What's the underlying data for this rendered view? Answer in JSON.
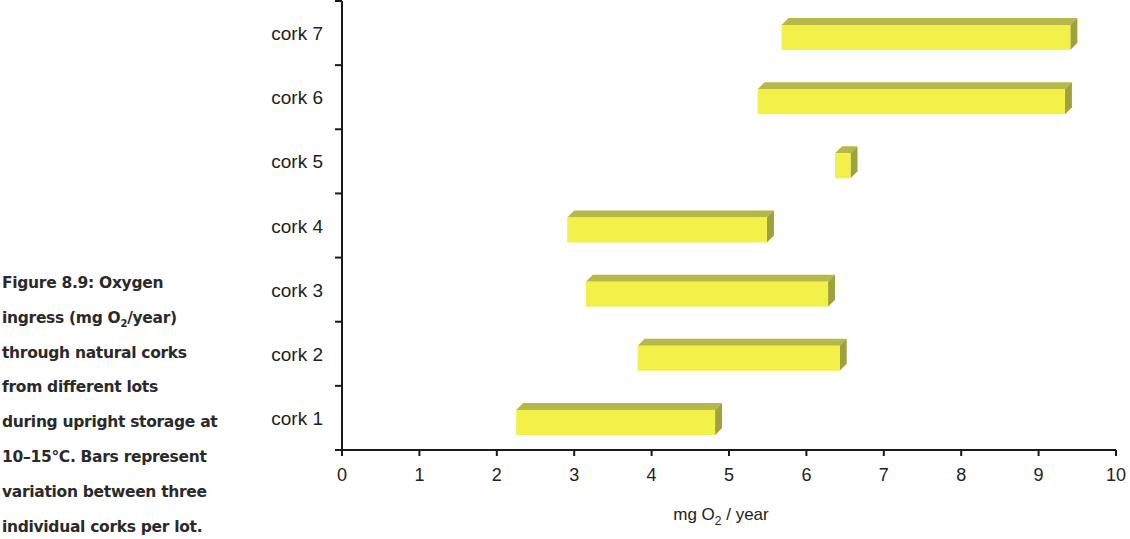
{
  "caption": {
    "lines": [
      "Figure 8.9: Oxygen",
      "ingress (mg O",
      "2",
      "/year)",
      "through natural corks",
      "from different lots",
      "during upright storage at",
      "10–15°C. Bars represent",
      "variation between three",
      "individual corks per lot."
    ]
  },
  "colors": {
    "bar_front": "#f3f04a",
    "bar_top": "#b6b84a",
    "bar_side": "#9da23c",
    "axis": "#1a1a1a"
  },
  "chart_data": {
    "type": "bar",
    "orientation": "horizontal-floating",
    "title": "Figure 8.9: Oxygen ingress (mg O2/year) through natural corks from different lots during upright storage at 10–15°C. Bars represent variation between three individual corks per lot.",
    "xlabel": "mg O2 / year",
    "xlabel_parts": {
      "pre": "mg O",
      "sub": "2",
      "post": " / year"
    },
    "ylabel": "",
    "xlim": [
      0,
      10
    ],
    "xticks": [
      "0",
      "1",
      "2",
      "3",
      "4",
      "5",
      "6",
      "7",
      "8",
      "9",
      "10"
    ],
    "grid": false,
    "legend": null,
    "categories": [
      "cork 1",
      "cork 2",
      "cork 3",
      "cork 4",
      "cork 5",
      "cork 6",
      "cork 7"
    ],
    "series": [
      {
        "name": "min",
        "values": [
          2.25,
          3.82,
          3.15,
          2.91,
          6.37,
          5.37,
          5.68
        ]
      },
      {
        "name": "max",
        "values": [
          4.82,
          6.43,
          6.28,
          5.49,
          6.57,
          9.34,
          9.41
        ]
      }
    ]
  }
}
